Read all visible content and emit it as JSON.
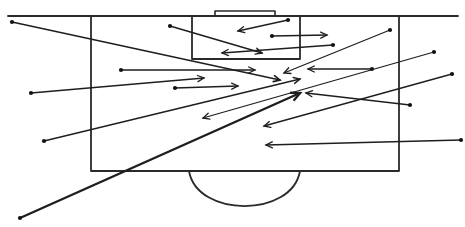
{
  "diagram": {
    "type": "football-pitch-pass-map",
    "stroke_color": "#2a2a2a",
    "arrow_color": "#1e1e1e",
    "background": "#ffffff",
    "pitch": {
      "touchline": {
        "x1": 8,
        "y1": 16,
        "x2": 458,
        "y2": 16
      },
      "penalty_box": {
        "x": 91,
        "y": 16,
        "w": 308,
        "h": 155
      },
      "goal_area": {
        "x": 192,
        "y": 16,
        "w": 108,
        "h": 43
      },
      "goal": {
        "x": 215,
        "y": 11,
        "w": 60,
        "h": 5
      },
      "penalty_arc": {
        "x1": 189,
        "x2": 300,
        "y": 171,
        "depth": 36
      }
    },
    "arrows": [
      {
        "x1": 12,
        "y1": 22,
        "x2": 280,
        "y2": 80,
        "width": 1.6
      },
      {
        "x1": 170,
        "y1": 26,
        "x2": 262,
        "y2": 53,
        "width": 1.4
      },
      {
        "x1": 288,
        "y1": 20,
        "x2": 238,
        "y2": 31,
        "width": 1.3
      },
      {
        "x1": 272,
        "y1": 36,
        "x2": 327,
        "y2": 35,
        "width": 1.3
      },
      {
        "x1": 333,
        "y1": 45,
        "x2": 222,
        "y2": 53,
        "width": 1.3
      },
      {
        "x1": 121,
        "y1": 70,
        "x2": 255,
        "y2": 70,
        "width": 1.3
      },
      {
        "x1": 31,
        "y1": 93,
        "x2": 204,
        "y2": 78,
        "width": 1.3
      },
      {
        "x1": 175,
        "y1": 88,
        "x2": 238,
        "y2": 86,
        "width": 1.3
      },
      {
        "x1": 390,
        "y1": 30,
        "x2": 284,
        "y2": 73,
        "width": 1.3
      },
      {
        "x1": 372,
        "y1": 69,
        "x2": 308,
        "y2": 69,
        "width": 1.3
      },
      {
        "x1": 44,
        "y1": 141,
        "x2": 300,
        "y2": 79,
        "width": 1.4
      },
      {
        "x1": 410,
        "y1": 105,
        "x2": 306,
        "y2": 93,
        "width": 1.3
      },
      {
        "x1": 434,
        "y1": 52,
        "x2": 203,
        "y2": 118,
        "width": 1.3
      },
      {
        "x1": 452,
        "y1": 74,
        "x2": 264,
        "y2": 126,
        "width": 1.3
      },
      {
        "x1": 461,
        "y1": 140,
        "x2": 266,
        "y2": 145,
        "width": 1.3
      },
      {
        "x1": 20,
        "y1": 218,
        "x2": 300,
        "y2": 93,
        "width": 2.4
      }
    ]
  }
}
